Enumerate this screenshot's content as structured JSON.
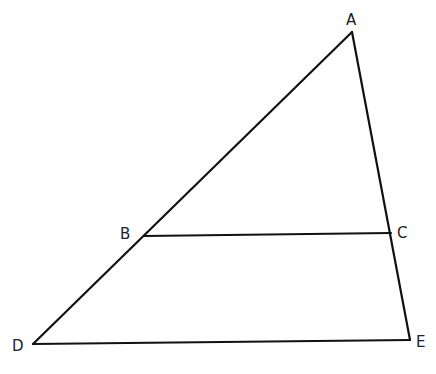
{
  "diagram": {
    "type": "triangle with parallel segment",
    "points": {
      "A": {
        "label": "A",
        "x": 352,
        "y": 32,
        "lx": 346,
        "ly": 25
      },
      "B": {
        "label": "B",
        "x": 144,
        "y": 236,
        "lx": 120,
        "ly": 239
      },
      "C": {
        "label": "C",
        "x": 391,
        "y": 233,
        "lx": 397,
        "ly": 238
      },
      "D": {
        "label": "D",
        "x": 33,
        "y": 344,
        "lx": 12,
        "ly": 351
      },
      "E": {
        "label": "E",
        "x": 410,
        "y": 340,
        "lx": 416,
        "ly": 347
      }
    },
    "segments": [
      {
        "name": "AD",
        "from": "A",
        "to": "D"
      },
      {
        "name": "AE",
        "from": "A",
        "to": "E"
      },
      {
        "name": "DE",
        "from": "D",
        "to": "E"
      },
      {
        "name": "BC",
        "from": "B",
        "to": "C"
      }
    ],
    "stroke_color": "#111111"
  }
}
